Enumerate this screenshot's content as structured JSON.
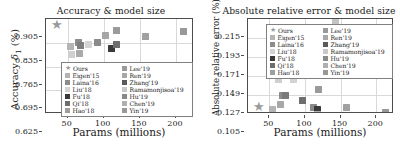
{
  "figure": {
    "background": "#ffffff",
    "panels": [
      "accuracy",
      "abs_rel_error"
    ]
  },
  "methods": [
    {
      "name": "Ours",
      "marker": "star",
      "color": "#9a9a9a"
    },
    {
      "name": "Eigen'15",
      "marker": "square",
      "color": "#b4b4b4"
    },
    {
      "name": "Laina'16",
      "marker": "square",
      "color": "#8c8c8c"
    },
    {
      "name": "Liu'18",
      "marker": "square",
      "color": "#d4d4d4"
    },
    {
      "name": "Fu'18",
      "marker": "square",
      "color": "#3a3a3a"
    },
    {
      "name": "Qi'18",
      "marker": "square",
      "color": "#6e6e6e"
    },
    {
      "name": "Hao'18",
      "marker": "square",
      "color": "#9e9e9e"
    },
    {
      "name": "Lee'19",
      "marker": "square",
      "color": "#9a9a9a"
    },
    {
      "name": "Ren'19",
      "marker": "square",
      "color": "#a8a8a8"
    },
    {
      "name": "Zhang'19",
      "marker": "square",
      "color": "#5a5a5a"
    },
    {
      "name": "Ramamonjisoa'19",
      "marker": "square",
      "color": "#c8c8c8"
    },
    {
      "name": "Hu'19",
      "marker": "square",
      "color": "#8a8a8a"
    },
    {
      "name": "Chen'19",
      "marker": "square",
      "color": "#b0b0b0"
    },
    {
      "name": "Yin'19",
      "marker": "square",
      "color": "#989898"
    }
  ],
  "chart_data": [
    {
      "id": "accuracy",
      "type": "scatter",
      "title": "Accuracy & model size",
      "xlabel": "Params (millions)",
      "ylabel_main": "Accuracy ",
      "ylabel_sub": "1",
      "ylabel_tail": " (%)",
      "xlim": [
        20,
        225
      ],
      "ylim": [
        0.625,
        0.905
      ],
      "xticks": [
        50,
        100,
        150,
        200
      ],
      "yticks": [
        "0.905",
        "0.835",
        "0.765",
        "0.695",
        "0.625"
      ],
      "ytick_values": [
        0.905,
        0.835,
        0.765,
        0.695,
        0.625
      ],
      "grid": true,
      "legend_position": "lower-center",
      "points": [
        {
          "label": "Ours",
          "x": 34,
          "y": 0.872,
          "marker": "star",
          "color": "#9a9a9a"
        },
        {
          "label": "Eigen'15",
          "x": 54,
          "y": 0.824,
          "marker": "square",
          "color": "#b4b4b4"
        },
        {
          "label": "Laina'16",
          "x": 55,
          "y": 0.799,
          "marker": "square",
          "color": "#cfcfcf"
        },
        {
          "label": "Liu'18",
          "x": 65,
          "y": 0.836,
          "marker": "square",
          "color": "#8c8c8c"
        },
        {
          "label": "Fu'18",
          "x": 68,
          "y": 0.827,
          "marker": "square",
          "color": "#7e7e7e"
        },
        {
          "label": "Qi'18",
          "x": 66,
          "y": 0.802,
          "marker": "square",
          "color": "#aaaaaa"
        },
        {
          "label": "Hao'18",
          "x": 79,
          "y": 0.831,
          "marker": "square",
          "color": "#d4d4d4"
        },
        {
          "label": "Lee'19",
          "x": 92,
          "y": 0.836,
          "marker": "square",
          "color": "#8a8a8a"
        },
        {
          "label": "Ren'19",
          "x": 103,
          "y": 0.857,
          "marker": "square",
          "color": "#a6a6a6"
        },
        {
          "label": "Zhang'19",
          "x": 111,
          "y": 0.818,
          "marker": "square",
          "color": "#3a3a3a"
        },
        {
          "label": "Ramamonjisoa'19",
          "x": 117,
          "y": 0.829,
          "marker": "square",
          "color": "#6e6e6e"
        },
        {
          "label": "Hu'19",
          "x": 117,
          "y": 0.871,
          "marker": "square",
          "color": "#9a9a9a"
        },
        {
          "label": "Chen'19",
          "x": 158,
          "y": 0.854,
          "marker": "square",
          "color": "#a0a0a0"
        },
        {
          "label": "Yin'19",
          "x": 211,
          "y": 0.869,
          "marker": "square",
          "color": "#989898"
        },
        {
          "label": "low-outlier",
          "x": 141,
          "y": 0.627,
          "marker": "square",
          "color": "#a8a8a8"
        }
      ]
    },
    {
      "id": "abs_rel_error",
      "type": "scatter",
      "title": "Absolute relative error & model size",
      "xlabel": "Params (millions)",
      "ylabel_main": "Absolute relative error (%)",
      "xlim": [
        20,
        225
      ],
      "ylim": [
        0.105,
        0.215
      ],
      "xticks": [
        50,
        100,
        150,
        200
      ],
      "yticks": [
        "0.215",
        "0.193",
        "0.171",
        "0.149",
        "0.127",
        "0.105"
      ],
      "ytick_values": [
        0.215,
        0.193,
        0.171,
        0.149,
        0.127,
        0.105
      ],
      "grid": true,
      "legend_position": "upper-center",
      "points": [
        {
          "label": "Ours",
          "x": 34,
          "y": 0.107,
          "marker": "star",
          "color": "#9a9a9a"
        },
        {
          "label": "Eigen'15",
          "x": 54,
          "y": 0.11,
          "marker": "square",
          "color": "#b4b4b4"
        },
        {
          "label": "Laina'16",
          "x": 63,
          "y": 0.145,
          "marker": "square",
          "color": "#cfcfcf"
        },
        {
          "label": "Liu'18",
          "x": 65,
          "y": 0.116,
          "marker": "square",
          "color": "#a8a8a8"
        },
        {
          "label": "Fu'18",
          "x": 68,
          "y": 0.127,
          "marker": "square",
          "color": "#8c8c8c"
        },
        {
          "label": "Qi'18",
          "x": 72,
          "y": 0.126,
          "marker": "square",
          "color": "#7a7a7a"
        },
        {
          "label": "Hao'18",
          "x": 84,
          "y": 0.145,
          "marker": "square",
          "color": "#d4d4d4"
        },
        {
          "label": "Lee'19",
          "x": 96,
          "y": 0.121,
          "marker": "square",
          "color": "#6e6e6e"
        },
        {
          "label": "Ren'19",
          "x": 112,
          "y": 0.113,
          "marker": "square",
          "color": "#8a8a8a"
        },
        {
          "label": "Zhang'19",
          "x": 117,
          "y": 0.11,
          "marker": "square",
          "color": "#3a3a3a"
        },
        {
          "label": "Ramamonjisoa'19",
          "x": 119,
          "y": 0.133,
          "marker": "square",
          "color": "#9a9a9a"
        },
        {
          "label": "Hu'19",
          "x": 118,
          "y": 0.105,
          "marker": "square",
          "color": "#b0b0b0"
        },
        {
          "label": "Chen'19",
          "x": 158,
          "y": 0.112,
          "marker": "square",
          "color": "#a0a0a0"
        },
        {
          "label": "Yin'19",
          "x": 213,
          "y": 0.107,
          "marker": "square",
          "color": "#989898"
        },
        {
          "label": "high-outlier",
          "x": 143,
          "y": 0.213,
          "marker": "square",
          "color": "#c4c4c4"
        }
      ]
    }
  ]
}
